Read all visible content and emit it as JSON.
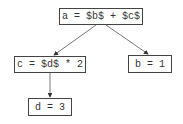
{
  "diagram": {
    "type": "tree",
    "nodes": [
      {
        "id": "a",
        "label": "a = $b$ + $c$"
      },
      {
        "id": "c",
        "label": "c = $d$ * 2"
      },
      {
        "id": "b",
        "label": "b = 1"
      },
      {
        "id": "d",
        "label": "d = 3"
      }
    ],
    "edges": [
      {
        "from": "a",
        "to": "c"
      },
      {
        "from": "a",
        "to": "b"
      },
      {
        "from": "c",
        "to": "d"
      }
    ]
  }
}
